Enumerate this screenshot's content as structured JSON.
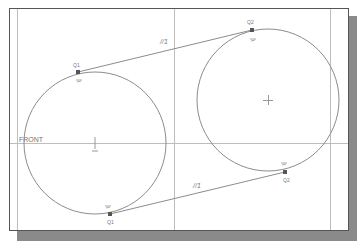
{
  "view": {
    "datum_label": "FRONT",
    "colors": {
      "background": "#ffffff",
      "frame": "#555555",
      "shadow": "#8a8a8a",
      "geometry": "#8c8c8c",
      "handle": "#555555",
      "text": "#777777"
    }
  },
  "sketch": {
    "circles": [
      {
        "name": "left-circle",
        "cx": 95,
        "cy": 143,
        "r": 71
      },
      {
        "name": "right-circle",
        "cx": 268,
        "cy": 100,
        "r": 71
      }
    ],
    "tangent_lines": [
      {
        "name": "upper-tangent",
        "x1": 78,
        "y1": 72,
        "x2": 252,
        "y2": 30,
        "constraint": "//1"
      },
      {
        "name": "lower-tangent",
        "x1": 110,
        "y1": 214,
        "x2": 285,
        "y2": 172,
        "constraint": "//1"
      }
    ],
    "tangent_points": [
      {
        "label": "Q1",
        "x": 78,
        "y": 72
      },
      {
        "label": "Q2",
        "x": 252,
        "y": 30
      },
      {
        "label": "Q1",
        "x": 110,
        "y": 214
      },
      {
        "label": "Q2",
        "x": 285,
        "y": 172
      }
    ],
    "constraint_symbols": [
      "//1",
      "//1"
    ]
  }
}
